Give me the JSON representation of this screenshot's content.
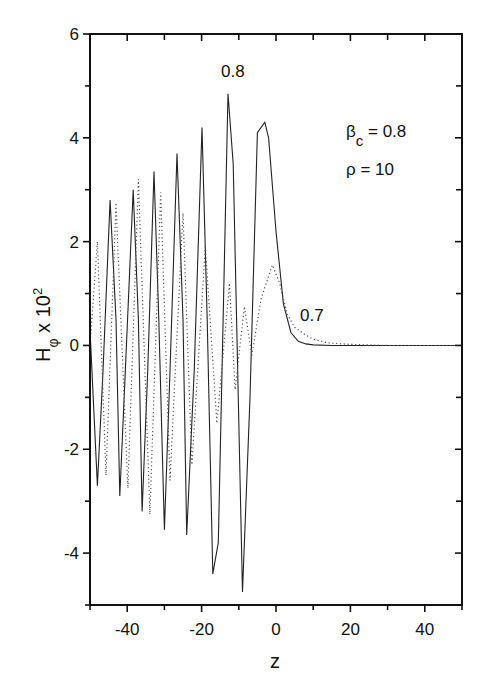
{
  "chart_data": {
    "type": "line",
    "title": "",
    "xlabel": "z",
    "ylabel": "H_φ x 10²",
    "ylabel_parts": {
      "main": "H",
      "sub": "φ",
      "mid": " x 10",
      "sup": "2"
    },
    "xlim": [
      -50,
      50
    ],
    "ylim": [
      -5,
      6
    ],
    "xticks": [
      -40,
      -20,
      0,
      20,
      40
    ],
    "xtick_labels": [
      "-40",
      "-20",
      "0",
      "20",
      "40"
    ],
    "xminor": [
      -50,
      -30,
      -10,
      10,
      30,
      50
    ],
    "yticks": [
      -4,
      -2,
      0,
      2,
      4,
      6
    ],
    "ytick_labels": [
      "-4",
      "-2",
      "0",
      "2",
      "4",
      "6"
    ],
    "yminor": [
      -5,
      -3,
      -1,
      1,
      3,
      5
    ],
    "grid": false,
    "legend": "none (inline curve labels)",
    "annotations": [
      {
        "text": "β_c = 0.8",
        "main": "β",
        "sub": "c",
        "rest": " = 0.8"
      },
      {
        "text": "ρ = 10"
      },
      {
        "text": "0.8",
        "target": "solid curve",
        "z": -12,
        "y": 5.3
      },
      {
        "text": "0.7",
        "target": "dotted curve",
        "z": 11,
        "y": 0.45
      }
    ],
    "series": [
      {
        "name": "0.8",
        "style": "solid",
        "x": [
          -50,
          -48,
          -46.5,
          -44.6,
          -43,
          -42,
          -40.5,
          -38.4,
          -37,
          -36,
          -34.5,
          -32.8,
          -31.5,
          -30,
          -28.5,
          -26.6,
          -25,
          -24,
          -22,
          -19.9,
          -18.5,
          -17,
          -15.5,
          -12.9,
          -11.5,
          -9,
          -7,
          -5,
          -4,
          -3,
          -2,
          0,
          2,
          4,
          6,
          8,
          10,
          15,
          20,
          30,
          40,
          50
        ],
        "y": [
          0.3,
          -2.7,
          -0.5,
          2.8,
          0.5,
          -2.9,
          -0.5,
          3.0,
          0.5,
          -3.2,
          -0.5,
          3.35,
          0.5,
          -3.55,
          -0.5,
          3.7,
          0.5,
          -3.65,
          -0.5,
          4.2,
          0.5,
          -4.4,
          -3.8,
          4.85,
          3.5,
          -4.75,
          -1.0,
          4.1,
          4.2,
          4.3,
          4.0,
          2.2,
          0.8,
          0.25,
          0.08,
          0.03,
          0.01,
          0,
          0,
          0,
          0,
          0
        ]
      },
      {
        "name": "0.7",
        "style": "dotted",
        "x": [
          -50,
          -48,
          -45.7,
          -43,
          -39.8,
          -37,
          -33.9,
          -31,
          -28.5,
          -25,
          -22.6,
          -19,
          -15.9,
          -12.5,
          -11,
          -8.5,
          -6.5,
          -4,
          -1,
          1,
          3,
          5,
          8,
          10,
          14,
          20,
          30,
          40,
          50
        ],
        "y": [
          0,
          2.0,
          -2.5,
          2.75,
          -2.75,
          3.2,
          -3.25,
          2.95,
          -2.6,
          2.55,
          -2.3,
          1.9,
          -1.5,
          1.2,
          -0.85,
          0.75,
          -0.2,
          0.9,
          1.55,
          1.2,
          0.6,
          0.35,
          0.2,
          0.12,
          0.05,
          0.02,
          0,
          0,
          0
        ]
      }
    ]
  }
}
